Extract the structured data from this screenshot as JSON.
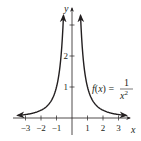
{
  "chart_data": {
    "type": "line",
    "title": "",
    "function_label": "f(x) = 1/x^2",
    "function_label_parts": {
      "lhs": "f(x) =",
      "num": "1",
      "den": "x",
      "exp": "2"
    },
    "xlabel": "x",
    "ylabel": "y",
    "xlim": [
      -3.7,
      3.7
    ],
    "ylim": [
      0,
      3.6
    ],
    "x_ticks": [
      -3,
      -2,
      -1,
      1,
      2,
      3
    ],
    "x_tick_labels": [
      "−3",
      "−2",
      "−1",
      "1",
      "2",
      "3"
    ],
    "y_ticks": [
      1,
      2,
      3
    ],
    "y_tick_labels": [
      "1",
      "2",
      ""
    ],
    "grid": false,
    "legend": "none",
    "series": [
      {
        "name": "f(x) = 1/x^2 (left branch)",
        "x": [
          -3.5,
          -3,
          -2.5,
          -2,
          -1.5,
          -1,
          -0.8,
          -0.7,
          -0.6,
          -0.55
        ],
        "y": [
          0.082,
          0.111,
          0.16,
          0.25,
          0.444,
          1.0,
          1.563,
          2.041,
          2.778,
          3.306
        ]
      },
      {
        "name": "f(x) = 1/x^2 (right branch)",
        "x": [
          0.55,
          0.6,
          0.7,
          0.8,
          1,
          1.5,
          2,
          2.5,
          3,
          3.5
        ],
        "y": [
          3.306,
          2.778,
          2.041,
          1.563,
          1.0,
          0.444,
          0.25,
          0.16,
          0.111,
          0.082
        ]
      }
    ],
    "color": "#231f20"
  }
}
